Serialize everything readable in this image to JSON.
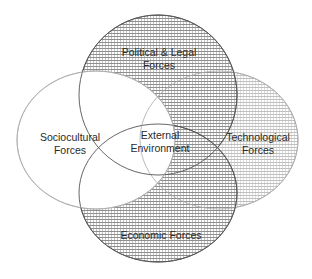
{
  "diagram": {
    "type": "venn",
    "center": {
      "line1": "External",
      "line2": "Environment"
    },
    "circles": [
      {
        "id": "political",
        "line1": "Political & Legal",
        "line2": "Forces",
        "pattern": "dense-hatch"
      },
      {
        "id": "sociocultural",
        "line1": "Sociocultural",
        "line2": "Forces",
        "pattern": "none"
      },
      {
        "id": "technological",
        "line1": "Technological",
        "line2": "Forces",
        "pattern": "light-hatch"
      },
      {
        "id": "economic",
        "line1": "Economic Forces",
        "line2": "",
        "pattern": "dense-hatch"
      }
    ],
    "colors": {
      "stroke_dark": "#555555",
      "stroke_light": "#aaaaaa",
      "hatch_dark": "#8a8a8a",
      "hatch_light": "#b8b8b8"
    }
  }
}
